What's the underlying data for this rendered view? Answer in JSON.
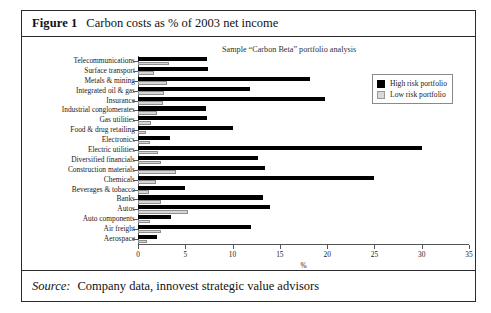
{
  "figure": {
    "label": "Figure 1",
    "title": "Carbon costs as % of 2003 net income",
    "subtitle": "Sample “Carbon Beta” portfolio analysis",
    "source_label": "Source:",
    "source_text": "Company data, innovest strategic value advisors"
  },
  "legend": {
    "position": "top-right",
    "entries": [
      {
        "label": "High risk portfolio",
        "color": "#000000"
      },
      {
        "label": "Low risk portfolio",
        "color": "#d6d6d6"
      }
    ]
  },
  "chart_data": {
    "type": "bar",
    "orientation": "horizontal",
    "title": "Carbon costs as % of 2003 net income",
    "subtitle": "Sample “Carbon Beta” portfolio analysis",
    "xlabel": "%",
    "ylabel": "",
    "xlim": [
      0,
      35
    ],
    "xticks": [
      0,
      5,
      10,
      15,
      20,
      25,
      30,
      35
    ],
    "grid": false,
    "legend_position": "top-right",
    "categories": [
      "Telecommunications",
      "Surface transport",
      "Metals & mining",
      "Integrated oil & gas",
      "Insurance",
      "Industrial conglomerates",
      "Gas utilities",
      "Food & drug retailing",
      "Electronics",
      "Electric utilities",
      "Diversified financials",
      "Construction materials",
      "Chemicals",
      "Beverages & tobacco",
      "Banks",
      "Autos",
      "Auto components",
      "Air freight",
      "Aerospace"
    ],
    "series": [
      {
        "name": "High risk portfolio",
        "color": "#000000",
        "values": [
          7.3,
          7.4,
          18.2,
          11.8,
          19.8,
          7.2,
          7.3,
          10.0,
          3.4,
          30.0,
          12.7,
          13.4,
          25.0,
          5.0,
          13.2,
          14.0,
          3.5,
          12.0,
          2.0
        ]
      },
      {
        "name": "Low risk portfolio",
        "color": "#d6d6d6",
        "values": [
          3.3,
          1.7,
          3.1,
          2.8,
          2.6,
          2.0,
          1.4,
          0.8,
          1.3,
          2.1,
          2.4,
          4.0,
          1.9,
          1.2,
          2.4,
          5.3,
          1.3,
          2.4,
          1.0
        ]
      }
    ]
  }
}
